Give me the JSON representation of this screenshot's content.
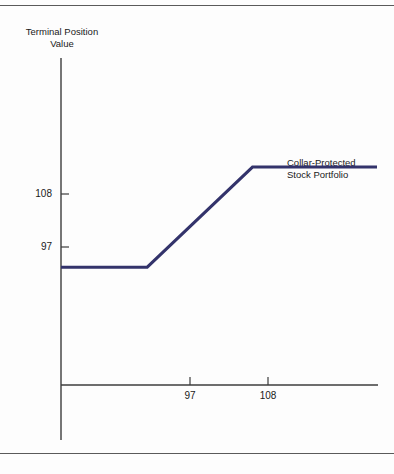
{
  "figure": {
    "has_top_rule": true,
    "has_bottom_rule": true,
    "background_color": "#fdfdfd",
    "rule_color": "#5a5a5a"
  },
  "chart_data": {
    "type": "line",
    "title": "",
    "subtitle": "",
    "ylabel": "Terminal Position\nValue",
    "xlabel": "",
    "annotations": [
      {
        "text": "Collar-Protected\nStock Portfolio",
        "x": 97,
        "y": 112
      }
    ],
    "legend": {
      "position": "inline-right",
      "entries": [
        "Collar-Protected Stock Portfolio"
      ]
    },
    "grid": false,
    "xlim": [
      88,
      121
    ],
    "ylim": [
      78,
      120
    ],
    "xticks": [
      97,
      108
    ],
    "xtick_labels": [
      "97",
      "108"
    ],
    "yticks": [
      97,
      108
    ],
    "ytick_labels": [
      "97",
      "108"
    ],
    "series": [
      {
        "name": "Collar-Protected Stock Portfolio",
        "color": "#33336b",
        "linewidth": 3,
        "x": [
          88,
          97,
          108,
          121
        ],
        "values": [
          97,
          97,
          108,
          108
        ]
      }
    ]
  },
  "labels": {
    "y_axis_title": "Terminal Position\nValue",
    "series_annotation": "Collar-Protected\nStock Portfolio",
    "y_tick_108": "108",
    "y_tick_97": "97",
    "x_tick_97": "97",
    "x_tick_108": "108"
  },
  "colors": {
    "line": "#33336b",
    "axis": "#3c3c3c",
    "text": "#1a1a1a"
  }
}
